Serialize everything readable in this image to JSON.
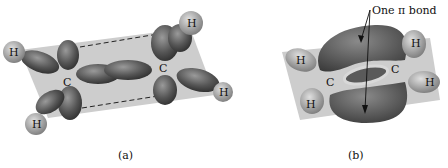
{
  "diagram": {
    "panel_a": {
      "caption": "(a)",
      "atoms": {
        "c1": "C",
        "c2": "C",
        "h1": "H",
        "h2": "H",
        "h3": "H",
        "h4": "H"
      }
    },
    "panel_b": {
      "caption": "(b)",
      "annotation": "One π bond",
      "atoms": {
        "c1": "C",
        "c2": "C",
        "h1": "H",
        "h2": "H",
        "h3": "H",
        "h4": "H"
      }
    },
    "colors": {
      "plane": "#c8c8c8",
      "lobe": "#555555",
      "lobe_light": "#8a8a8a",
      "hydrogen": "#b0b0b0"
    }
  }
}
